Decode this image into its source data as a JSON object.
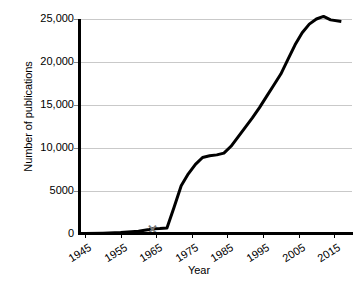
{
  "chart_data": {
    "type": "line",
    "title": "",
    "xlabel": "Year",
    "ylabel": "Number of publications",
    "xlim": [
      1943,
      2020
    ],
    "ylim": [
      0,
      25000
    ],
    "grid": true,
    "legend_position": "none",
    "xticks": [
      "1945",
      "1955",
      "1965",
      "1975",
      "1985",
      "1995",
      "2005",
      "2015"
    ],
    "xtick_values": [
      1945,
      1955,
      1965,
      1975,
      1985,
      1995,
      2005,
      2015
    ],
    "yticks": [
      "0",
      "5000",
      "10,000",
      "15,000",
      "20,000",
      "25,000"
    ],
    "ytick_values": [
      0,
      5000,
      10000,
      15000,
      20000,
      25000
    ],
    "series": [
      {
        "name": "Number of publications",
        "x": [
          1945,
          1950,
          1955,
          1960,
          1963,
          1964,
          1966,
          1968,
          1970,
          1972,
          1974,
          1976,
          1978,
          1980,
          1982,
          1984,
          1986,
          1988,
          1990,
          1992,
          1994,
          1996,
          1998,
          2000,
          2002,
          2004,
          2006,
          2008,
          2010,
          2012,
          2014,
          2017
        ],
        "values": [
          60,
          100,
          180,
          320,
          520,
          600,
          640,
          700,
          3100,
          5600,
          7000,
          8100,
          8900,
          9100,
          9200,
          9400,
          10200,
          11300,
          12400,
          13500,
          14700,
          16000,
          17300,
          18600,
          20300,
          22000,
          23400,
          24400,
          25000,
          25300,
          24900,
          24700
        ]
      }
    ],
    "annotations": [
      {
        "name": "x-marker",
        "label": "✕",
        "x": 1964,
        "y": 600,
        "color": "#7a7a7a"
      }
    ],
    "colors": {
      "line": "#000000",
      "grid": "#c9c9c9",
      "axis": "#000000",
      "marker": "#7a7a7a",
      "background": "#ffffff"
    }
  }
}
